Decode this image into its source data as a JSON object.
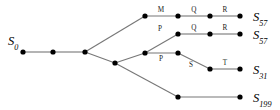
{
  "diagram": {
    "type": "tree",
    "title": "",
    "background_color": "#ffffff",
    "node_color": "#000000",
    "edge_color": "#777777",
    "label_color": "#000000",
    "root_label": "S",
    "root_subscript": "0",
    "nodes": [
      {
        "id": "n0",
        "x": 23,
        "y": 52,
        "name": "root-node"
      },
      {
        "id": "n1",
        "x": 53,
        "y": 52,
        "name": "chain-node-1"
      },
      {
        "id": "n2",
        "x": 85,
        "y": 52,
        "name": "branch-node-main"
      },
      {
        "id": "n3",
        "x": 145,
        "y": 16,
        "name": "branch1-node-1"
      },
      {
        "id": "n4",
        "x": 178,
        "y": 16,
        "name": "branch1-node-2"
      },
      {
        "id": "n5",
        "x": 210,
        "y": 16,
        "name": "branch1-node-3"
      },
      {
        "id": "n6",
        "x": 240,
        "y": 16,
        "name": "branch1-terminal"
      },
      {
        "id": "n7",
        "x": 115,
        "y": 63,
        "name": "branch-node-lower"
      },
      {
        "id": "n8",
        "x": 145,
        "y": 53,
        "name": "branch2-node-1"
      },
      {
        "id": "n9",
        "x": 178,
        "y": 34,
        "name": "branch2-node-2"
      },
      {
        "id": "n10",
        "x": 210,
        "y": 34,
        "name": "branch2-node-3"
      },
      {
        "id": "n11",
        "x": 240,
        "y": 34,
        "name": "branch2-terminal"
      },
      {
        "id": "n12",
        "x": 178,
        "y": 53,
        "name": "branch3-node-2"
      },
      {
        "id": "n13",
        "x": 210,
        "y": 69,
        "name": "branch3-node-3"
      },
      {
        "id": "n14",
        "x": 240,
        "y": 69,
        "name": "branch3-terminal"
      },
      {
        "id": "n15",
        "x": 178,
        "y": 97,
        "name": "branch4-node-1"
      },
      {
        "id": "n16",
        "x": 240,
        "y": 97,
        "name": "branch4-terminal"
      }
    ],
    "edges": [
      {
        "from": "n0",
        "to": "n1",
        "label": ""
      },
      {
        "from": "n1",
        "to": "n2",
        "label": ""
      },
      {
        "from": "n2",
        "to": "n3",
        "label": ""
      },
      {
        "from": "n3",
        "to": "n4",
        "label": "M",
        "lx": 161,
        "ly": 12
      },
      {
        "from": "n4",
        "to": "n5",
        "label": "Q",
        "lx": 194,
        "ly": 12
      },
      {
        "from": "n5",
        "to": "n6",
        "label": "R",
        "lx": 225,
        "ly": 12
      },
      {
        "from": "n2",
        "to": "n7",
        "label": ""
      },
      {
        "from": "n7",
        "to": "n8",
        "label": ""
      },
      {
        "from": "n8",
        "to": "n9",
        "label": "P",
        "lx": 160,
        "ly": 31
      },
      {
        "from": "n9",
        "to": "n10",
        "label": "Q",
        "lx": 194,
        "ly": 30
      },
      {
        "from": "n10",
        "to": "n11",
        "label": "R",
        "lx": 225,
        "ly": 30
      },
      {
        "from": "n8",
        "to": "n12",
        "label": "P",
        "lx": 161,
        "ly": 61
      },
      {
        "from": "n12",
        "to": "n13",
        "label": "S",
        "lx": 191,
        "ly": 67
      },
      {
        "from": "n13",
        "to": "n14",
        "label": "T",
        "lx": 225,
        "ly": 65
      },
      {
        "from": "n7",
        "to": "n15",
        "label": ""
      },
      {
        "from": "n15",
        "to": "n16",
        "label": ""
      }
    ],
    "terminal_labels": [
      {
        "text": "S",
        "subscript": "57",
        "x": 253,
        "y": 21,
        "name": "state-label-s57-top"
      },
      {
        "text": "S",
        "subscript": "57",
        "x": 253,
        "y": 39,
        "name": "state-label-s57-second"
      },
      {
        "text": "S",
        "subscript": "31",
        "x": 253,
        "y": 74,
        "name": "state-label-s31"
      },
      {
        "text": "S",
        "subscript": "199",
        "x": 253,
        "y": 102,
        "name": "state-label-s199"
      }
    ],
    "root_label_pos": {
      "x": 8,
      "y": 45
    },
    "edge_label_texts": [
      "M",
      "Q",
      "R",
      "P",
      "Q",
      "R",
      "P",
      "S",
      "T"
    ]
  }
}
